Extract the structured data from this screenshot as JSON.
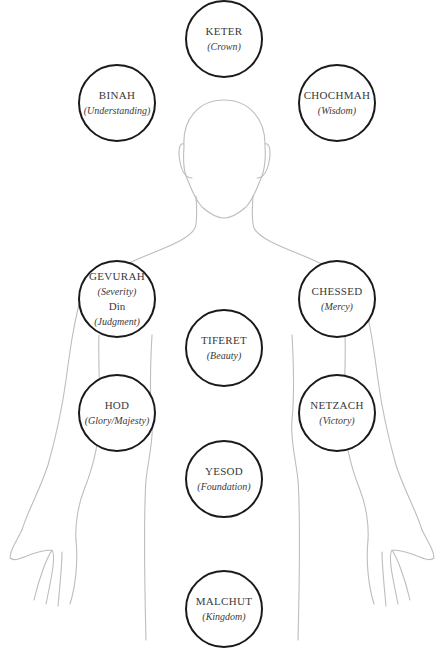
{
  "diagram": {
    "type": "tree-of-life-body-map",
    "colors": {
      "circle_stroke": "#1a1a1a",
      "outline_stroke": "#bdbdbd",
      "text": "#3a3a3a",
      "background": "#ffffff"
    },
    "nodes": [
      {
        "id": "keter",
        "name": "KETER",
        "meaning": "(Crown)",
        "cx": 224,
        "cy": 38
      },
      {
        "id": "binah",
        "name": "BINAH",
        "meaning": "(Understanding)",
        "cx": 117,
        "cy": 102
      },
      {
        "id": "chochmah",
        "name": "CHOCHMAH",
        "meaning": "(Wisdom)",
        "cx": 337,
        "cy": 102
      },
      {
        "id": "gevurah",
        "name": "GEVURAH",
        "meaning": "(Severity)",
        "extra": "Din",
        "extra_meaning": "(Judgment)",
        "cx": 117,
        "cy": 298
      },
      {
        "id": "chessed",
        "name": "CHESSED",
        "meaning": "(Mercy)",
        "cx": 337,
        "cy": 298
      },
      {
        "id": "tiferet",
        "name": "TIFERET",
        "meaning": "(Beauty)",
        "cx": 224,
        "cy": 347
      },
      {
        "id": "hod",
        "name": "HOD",
        "meaning": "(Glory/Majesty)",
        "cx": 117,
        "cy": 412
      },
      {
        "id": "netzach",
        "name": "NETZACH",
        "meaning": "(Victory)",
        "cx": 337,
        "cy": 412
      },
      {
        "id": "yesod",
        "name": "YESOD",
        "meaning": "(Foundation)",
        "cx": 224,
        "cy": 478
      },
      {
        "id": "malchut",
        "name": "MALCHUT",
        "meaning": "(Kingdom)",
        "cx": 224,
        "cy": 608
      }
    ]
  }
}
